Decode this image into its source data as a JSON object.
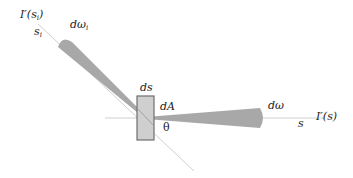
{
  "diagram": {
    "labels": {
      "incident_radiance": "I′(s",
      "incident_radiance_sub": "i",
      "incident_radiance_close": ")",
      "incident_dir": "s",
      "incident_dir_sub": "i",
      "incident_solid_angle": "dω",
      "incident_solid_angle_sub": "i",
      "surface_length": "ds",
      "area_element": "dA",
      "angle": "θ",
      "outgoing_solid_angle": "dω",
      "outgoing_dir": "s",
      "outgoing_radiance": "I′(s)"
    },
    "colors": {
      "cone_fill": "#a8a8a8",
      "line": "#c8c8c8",
      "element_fill": "#cfcfcf",
      "element_stroke": "#6e6e6e"
    }
  }
}
